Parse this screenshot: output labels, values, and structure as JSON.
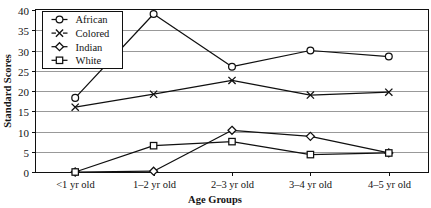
{
  "figure": {
    "title_remnant": "",
    "background_color": "#ffffff",
    "line_color": "#101010",
    "grid_color": "#8e8e8e"
  },
  "chart_data": {
    "type": "line",
    "title": "",
    "xlabel": "Age Groups",
    "ylabel": "Standard Scores",
    "categories": [
      "<1 yr old",
      "1–2 yr old",
      "2–3 yr old",
      "3–4 yr old",
      "4–5 yr old"
    ],
    "ylim": [
      0,
      40
    ],
    "yticks": [
      0,
      5,
      10,
      15,
      20,
      25,
      30,
      35,
      40
    ],
    "ytick_labels": [
      "0",
      "5",
      "10",
      "15",
      "20",
      "25",
      "30",
      "35",
      "40"
    ],
    "grid": "horizontal",
    "legend_position": "upper-left-inside",
    "series": [
      {
        "name": "African",
        "marker": "circle",
        "values": [
          18.3,
          39.0,
          26.0,
          30.0,
          28.5
        ]
      },
      {
        "name": "Colored",
        "marker": "x",
        "values": [
          16.0,
          19.2,
          22.6,
          19.0,
          19.7
        ]
      },
      {
        "name": "Indian",
        "marker": "diamond",
        "values": [
          0.0,
          0.2,
          10.3,
          8.8,
          4.7
        ]
      },
      {
        "name": "White",
        "marker": "square",
        "values": [
          0.0,
          6.5,
          7.5,
          4.3,
          4.7
        ]
      }
    ]
  },
  "legend": {
    "items": [
      {
        "label": "African",
        "marker": "circle"
      },
      {
        "label": "Colored",
        "marker": "x"
      },
      {
        "label": "Indian",
        "marker": "diamond"
      },
      {
        "label": "White",
        "marker": "square"
      }
    ]
  }
}
